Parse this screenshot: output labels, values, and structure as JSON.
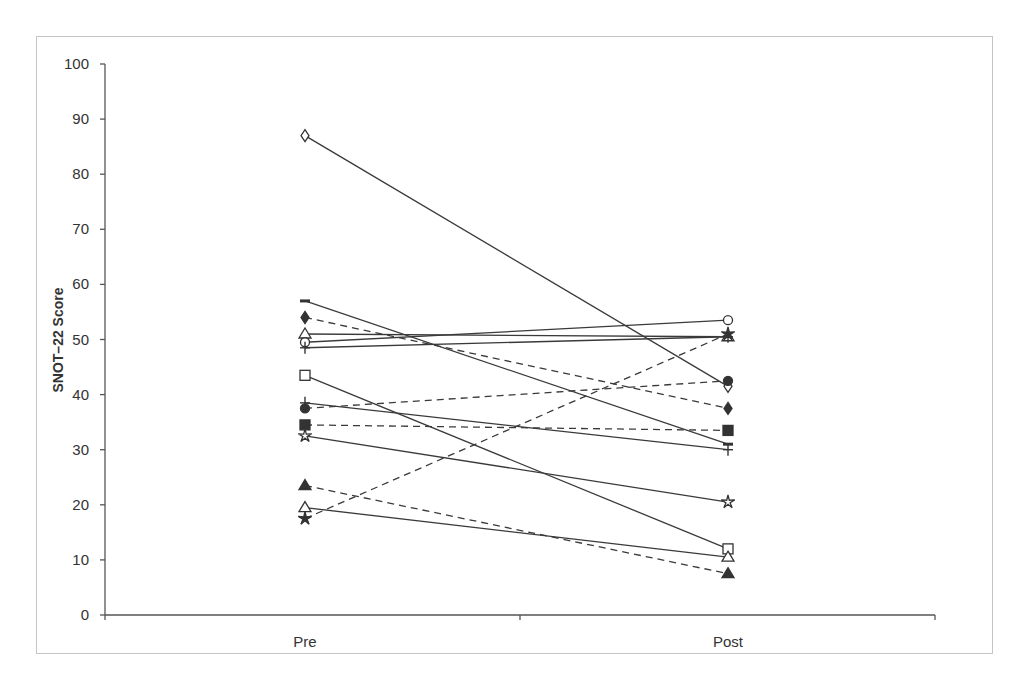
{
  "chart_data": {
    "type": "line",
    "title": "",
    "xlabel": "",
    "ylabel": "SNOT–22 Score",
    "categories": [
      "Pre",
      "Post"
    ],
    "ylim": [
      0,
      100
    ],
    "yticks": [
      0,
      10,
      20,
      30,
      40,
      50,
      60,
      70,
      80,
      90,
      100
    ],
    "grid": false,
    "legend": "none",
    "series": [
      {
        "name": "Patient 1",
        "marker": "diamond-open",
        "line": "solid",
        "values": [
          87,
          41.5
        ]
      },
      {
        "name": "Patient 2",
        "marker": "dash",
        "line": "solid",
        "values": [
          57,
          31
        ]
      },
      {
        "name": "Patient 3",
        "marker": "diamond-filled",
        "line": "dashed",
        "values": [
          54,
          37.5
        ]
      },
      {
        "name": "Patient 4",
        "marker": "triangle-open",
        "line": "solid",
        "values": [
          51,
          50.5
        ]
      },
      {
        "name": "Patient 5",
        "marker": "circle-open",
        "line": "solid",
        "values": [
          49.5,
          53.5
        ]
      },
      {
        "name": "Patient 6",
        "marker": "plus",
        "line": "solid",
        "values": [
          48.5,
          50.5
        ]
      },
      {
        "name": "Patient 7",
        "marker": "square-open",
        "line": "solid",
        "values": [
          43.5,
          12
        ]
      },
      {
        "name": "Patient 8",
        "marker": "plus",
        "line": "solid",
        "values": [
          38.5,
          30
        ]
      },
      {
        "name": "Patient 9",
        "marker": "circle-filled",
        "line": "dashed",
        "values": [
          37.5,
          42.5
        ]
      },
      {
        "name": "Patient 10",
        "marker": "square-filled",
        "line": "dashed",
        "values": [
          34.5,
          33.5
        ]
      },
      {
        "name": "Patient 11",
        "marker": "star-open",
        "line": "solid",
        "values": [
          32.5,
          20.5
        ]
      },
      {
        "name": "Patient 12",
        "marker": "triangle-filled",
        "line": "dashed",
        "values": [
          23.5,
          7.5
        ]
      },
      {
        "name": "Patient 13",
        "marker": "triangle-open",
        "line": "solid",
        "values": [
          19.5,
          10.5
        ]
      },
      {
        "name": "Patient 14",
        "marker": "star-filled",
        "line": "dashed",
        "values": [
          17.5,
          51
        ]
      }
    ]
  }
}
